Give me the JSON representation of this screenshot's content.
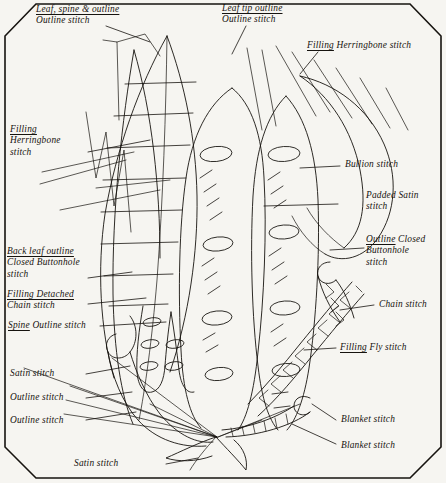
{
  "figure": {
    "background_color": "#f6f5f1",
    "ink_color": "#16130f",
    "frame": "beveled-corner rectangle border"
  },
  "labels": {
    "leaf_spine_outline": {
      "line1": "Leaf, spine & outline",
      "line2": "Outline stitch"
    },
    "leaf_tip_outline": {
      "line1": "Leaf tip outline",
      "line2": "Outline stitch"
    },
    "filling_herringbone_right": {
      "line1": "Filling",
      "line2": "Herringbone stitch"
    },
    "filling_herringbone_left": {
      "line1": "Filling",
      "line2": "Herringbone",
      "line3": "stitch"
    },
    "bullion": {
      "line1": "Bullion stitch"
    },
    "padded_satin": {
      "line1": "Padded Satin",
      "line2": "stitch"
    },
    "back_leaf_outline": {
      "line1": "Back leaf outline",
      "line2": "Closed Buttonhole",
      "line3": "stitch"
    },
    "outline_closed_buttonhole": {
      "line1": "Outline",
      "line1b": "Closed",
      "line2": "Buttonhole",
      "line3": "stitch"
    },
    "filling_detached_chain": {
      "line1": "Filling Detached",
      "line2": "Chain stitch"
    },
    "chain": {
      "line1": "Chain stitch"
    },
    "spine_outline": {
      "line1": "Spine",
      "line1b": "Outline stitch"
    },
    "filling_fly": {
      "line1": "Filling",
      "line1b": "Fly stitch"
    },
    "satin_left": {
      "line1": "Satin stitch"
    },
    "outline_left_1": {
      "line1": "Outline stitch"
    },
    "outline_left_2": {
      "line1": "Outline  stitch"
    },
    "blanket_upper": {
      "line1": "Blanket stitch"
    },
    "blanket_lower": {
      "line1": "Blanket stitch"
    },
    "satin_bottom": {
      "line1": "Satin stitch"
    }
  }
}
